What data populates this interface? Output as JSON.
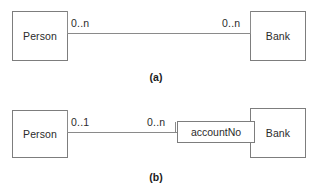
{
  "figure": {
    "type": "uml-class-diagram",
    "colors": {
      "stroke": "#7d7d7d",
      "line": "#8a8a8a",
      "text": "#2b2b2b",
      "background": "#ffffff"
    },
    "parts": [
      {
        "caption": "(a)",
        "left_entity": "Person",
        "right_entity": "Bank",
        "left_multiplicity": "0..n",
        "right_multiplicity": "0..n",
        "association_attribute": null
      },
      {
        "caption": "(b)",
        "left_entity": "Person",
        "right_entity": "Bank",
        "left_multiplicity": "0..1",
        "right_multiplicity": "0..n",
        "association_attribute": "accountNo"
      }
    ]
  }
}
